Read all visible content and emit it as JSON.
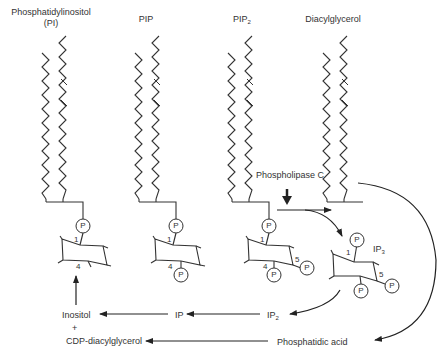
{
  "diagram": {
    "title_labels": {
      "pi": "Phosphatidylinositol",
      "pi_abbrev": "(PI)",
      "pip": "PIP",
      "pip2_main": "PIP",
      "pip2_sub": "2",
      "dag": "Diacylglycerol"
    },
    "enzyme": "Phospholipase C",
    "ip3_main": "IP",
    "ip3_sub": "3",
    "ring_numbers": {
      "pi_c1": "1",
      "pi_c4": "4",
      "pip_c1": "1",
      "pip_c4": "4",
      "pip2_c1": "1",
      "pip2_c4": "4",
      "pip2_c5": "5",
      "ip3_c1": "1",
      "ip3_c5": "5"
    },
    "phosphate": "P",
    "pathway": {
      "inositol": "Inositol",
      "plus": "+",
      "cdp_dag": "CDP-diacylglycerol",
      "ip": "IP",
      "ip2_main": "IP",
      "ip2_sub": "2",
      "phosphatidic_acid": "Phosphatidic acid"
    }
  }
}
